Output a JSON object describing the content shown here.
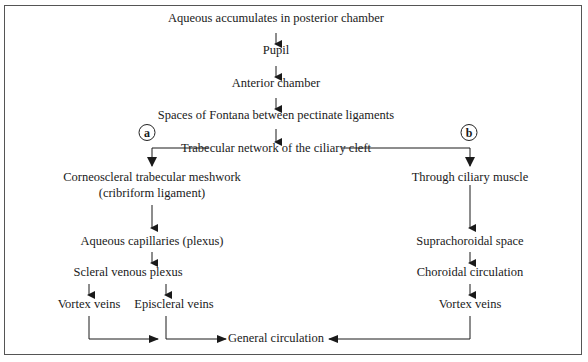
{
  "diagram": {
    "nodes": {
      "posterior": "Aqueous accumulates in posterior chamber",
      "pupil": "Pupil",
      "anterior": "Anterior chamber",
      "fontana": "Spaces of Fontana between pectinate ligaments",
      "trabecular": "Trabecular network of the ciliary cleft",
      "corneoscleral_1": "Corneoscleral trabecular meshwork",
      "corneoscleral_2": "(cribriform ligament)",
      "aqueous_cap": "Aqueous capillaries (plexus)",
      "scleral_plexus": "Scleral venous plexus",
      "vortex_left": "Vortex veins",
      "episcleral": "Episcleral veins",
      "ciliary_muscle": "Through ciliary muscle",
      "suprachoroidal": "Suprachoroidal space",
      "choroidal": "Choroidal circulation",
      "vortex_right": "Vortex veins",
      "general": "General circulation"
    },
    "route_labels": {
      "a": "a",
      "b": "b"
    }
  }
}
